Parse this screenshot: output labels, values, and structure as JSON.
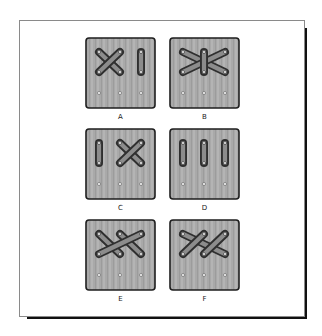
{
  "figure": {
    "colors": {
      "panel_fill": "#a9a9a9",
      "panel_border": "#1e1e1e",
      "loop_outline": "#2f2f2f",
      "loop_fill": "#8c8c8c",
      "hole": "#f4f4f4",
      "frame_border": "#8a8a8a",
      "shadow": "#111111"
    },
    "grid": {
      "columns_x": [
        14,
        35,
        56
      ],
      "top_row_y": 15,
      "middle_row_y": 35,
      "bottom_row_y": 56
    },
    "panels": [
      {
        "label": "A",
        "loops": [
          {
            "from": [
              0,
              "top"
            ],
            "to": [
              1,
              "mid"
            ]
          },
          {
            "from": [
              1,
              "top"
            ],
            "to": [
              0,
              "mid"
            ]
          },
          {
            "from": [
              2,
              "top"
            ],
            "to": [
              2,
              "mid"
            ]
          }
        ]
      },
      {
        "label": "B",
        "loops": [
          {
            "from": [
              0,
              "top"
            ],
            "to": [
              2,
              "mid"
            ]
          },
          {
            "from": [
              2,
              "top"
            ],
            "to": [
              0,
              "mid"
            ]
          },
          {
            "from": [
              1,
              "top"
            ],
            "to": [
              1,
              "mid"
            ]
          }
        ]
      },
      {
        "label": "C",
        "loops": [
          {
            "from": [
              0,
              "top"
            ],
            "to": [
              0,
              "mid"
            ]
          },
          {
            "from": [
              1,
              "top"
            ],
            "to": [
              2,
              "mid"
            ]
          },
          {
            "from": [
              2,
              "top"
            ],
            "to": [
              1,
              "mid"
            ]
          }
        ]
      },
      {
        "label": "D",
        "loops": [
          {
            "from": [
              0,
              "top"
            ],
            "to": [
              0,
              "mid"
            ]
          },
          {
            "from": [
              1,
              "top"
            ],
            "to": [
              1,
              "mid"
            ]
          },
          {
            "from": [
              2,
              "top"
            ],
            "to": [
              2,
              "mid"
            ]
          }
        ]
      },
      {
        "label": "E",
        "loops": [
          {
            "from": [
              0,
              "top"
            ],
            "to": [
              1,
              "mid"
            ]
          },
          {
            "from": [
              1,
              "top"
            ],
            "to": [
              2,
              "mid"
            ]
          },
          {
            "from": [
              2,
              "top"
            ],
            "to": [
              0,
              "mid"
            ]
          }
        ]
      },
      {
        "label": "F",
        "loops": [
          {
            "from": [
              0,
              "top"
            ],
            "to": [
              2,
              "mid"
            ]
          },
          {
            "from": [
              1,
              "top"
            ],
            "to": [
              0,
              "mid"
            ]
          },
          {
            "from": [
              2,
              "top"
            ],
            "to": [
              1,
              "mid"
            ]
          }
        ]
      }
    ]
  }
}
